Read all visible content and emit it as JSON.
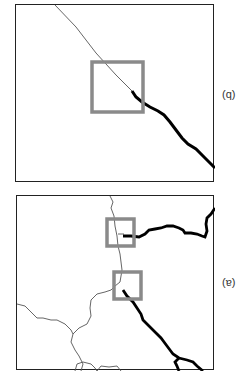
{
  "figure": {
    "panels": [
      {
        "id": "q",
        "label": "(q)",
        "description": "Zoomed view: thin line entering from top, thick line continuing to bottom-right, highlight box at transition"
      },
      {
        "id": "a",
        "label": "(ɐ)",
        "description": "Overview map: thin boundaries network, two thick lines, two highlight boxes"
      }
    ],
    "colors": {
      "frame": "#222222",
      "thin_line": "#555555",
      "thick_line": "#000000",
      "highlight_box": "#8a8a8a"
    }
  }
}
